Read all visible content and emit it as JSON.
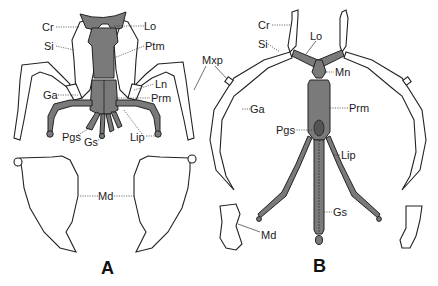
{
  "figure": {
    "panels": [
      {
        "id": "A",
        "label": "A"
      },
      {
        "id": "B",
        "label": "B"
      }
    ],
    "colors": {
      "sclerite_fill": "#7a7a7a",
      "outline": "#222222",
      "background": "#ffffff"
    }
  },
  "labels_a": {
    "cr": "Cr",
    "si": "Si",
    "lo": "Lo",
    "ptm": "Ptm",
    "ga": "Ga",
    "ln": "Ln",
    "prm": "Prm",
    "pgs": "Pgs",
    "gs": "Gs",
    "lip": "Lip",
    "md": "Md"
  },
  "labels_shared": {
    "mxp": "Mxp"
  },
  "labels_b": {
    "cr": "Cr",
    "si": "Si",
    "lo": "Lo",
    "mn": "Mn",
    "ga": "Ga",
    "prm": "Prm",
    "pgs": "Pgs",
    "lip": "Lip",
    "gs": "Gs",
    "md": "Md"
  }
}
